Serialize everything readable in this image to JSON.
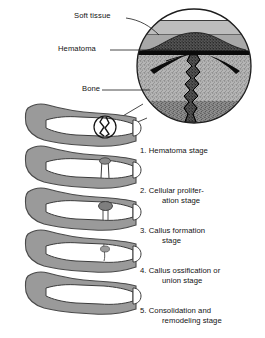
{
  "figure": {
    "background_color": "#ffffff",
    "colors": {
      "soft_tissue_fill": "#9a9a9a",
      "soft_tissue_outline": "#4d4d4d",
      "bone_fill": "#ffffff",
      "bone_outline": "#3c3c3c",
      "bone_texture": "#8c8c8c",
      "hematoma": "#111111",
      "callus": "#6e6e6e",
      "leader_line": "#222222",
      "text": "#111111"
    }
  },
  "callouts": [
    {
      "id": "soft-tissue",
      "label": "Soft tissue"
    },
    {
      "id": "hematoma",
      "label": "Hematoma"
    },
    {
      "id": "bone",
      "label": "Bone"
    }
  ],
  "magnifier": {
    "name": "magnified-fracture-inset",
    "description": "Circular magnified view of fracture site showing soft tissue, hematoma and fractured bone"
  },
  "stages": [
    {
      "number": "1.",
      "label": "Hematoma stage",
      "line1": "Hematoma stage",
      "line2": ""
    },
    {
      "number": "2.",
      "label": "Cellular proliferation stage",
      "line1": "Cellular prolifer-",
      "line2": "ation stage"
    },
    {
      "number": "3.",
      "label": "Callus formation stage",
      "line1": "Callus formation",
      "line2": "stage"
    },
    {
      "number": "4.",
      "label": "Callus ossification or union stage",
      "line1": "Callus ossification or",
      "line2": "union stage"
    },
    {
      "number": "5.",
      "label": "Consolidation and remodeling stage",
      "line1": "Consolidation and",
      "line2": "remodeling stage"
    }
  ]
}
